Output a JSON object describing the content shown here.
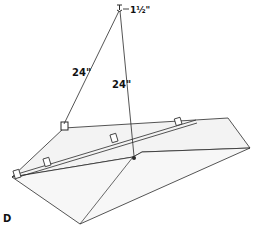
{
  "figure": {
    "label": "D",
    "dimensions": {
      "hook_spacing": "1½\"",
      "left_wire_length": "24\"",
      "right_wire_length": "24\""
    },
    "colors": {
      "line": "#2a2a2a",
      "surface": "#f4f4f4",
      "background": "#ffffff"
    }
  }
}
